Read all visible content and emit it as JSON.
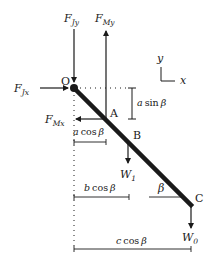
{
  "diagram": {
    "type": "free-body-diagram",
    "colors": {
      "ink": "#1a1a1a",
      "background": "#ffffff"
    },
    "points": {
      "O": {
        "label": "O",
        "x": 74,
        "y": 88
      },
      "A": {
        "label": "A",
        "x": 106,
        "y": 119
      },
      "B": {
        "label": "B",
        "x": 128,
        "y": 140
      },
      "C": {
        "label": "C",
        "x": 191,
        "y": 205
      }
    },
    "forces": {
      "F_Jy": {
        "main": "F",
        "sub": "Jy",
        "direction": "down",
        "at": "O"
      },
      "F_My": {
        "main": "F",
        "sub": "My",
        "direction": "up",
        "at": "A"
      },
      "F_Jx": {
        "main": "F",
        "sub": "Jx",
        "direction": "right",
        "at": "O"
      },
      "F_Mx": {
        "main": "F",
        "sub": "Mx",
        "direction": "left",
        "at": "A"
      },
      "W_1": {
        "main": "W",
        "sub": "1",
        "direction": "down",
        "at": "B"
      },
      "W_0": {
        "main": "W",
        "sub": "0",
        "direction": "down",
        "at": "C"
      }
    },
    "axes": {
      "y_label": "y",
      "x_label": "x"
    },
    "dimensions": {
      "a_sin": {
        "coef": "a",
        "func": "sin",
        "angle": "β"
      },
      "a_cos": {
        "coef": "a",
        "func": "cos",
        "angle": "β"
      },
      "b_cos": {
        "coef": "b",
        "func": "cos",
        "angle": "β"
      },
      "c_cos": {
        "coef": "c",
        "func": "cos",
        "angle": "β"
      }
    },
    "angle": {
      "label": "β"
    }
  }
}
